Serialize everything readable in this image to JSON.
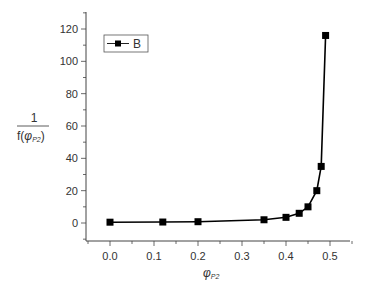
{
  "chart_data": {
    "type": "line",
    "title": "",
    "xlabel": "φ_P2",
    "ylabel": "1 / f(φ_P2)",
    "xlim": [
      -0.1,
      0.55
    ],
    "ylim": [
      -10,
      130
    ],
    "x_ticks": [
      0.0,
      0.1,
      0.2,
      0.3,
      0.4,
      0.5
    ],
    "x_tick_labels": [
      "0.0",
      "0.1",
      "0.2",
      "0.3",
      "0.4",
      "0.5"
    ],
    "y_ticks": [
      0,
      20,
      40,
      60,
      80,
      100,
      120
    ],
    "y_tick_labels": [
      "0",
      "20",
      "40",
      "60",
      "80",
      "100",
      "120"
    ],
    "grid": false,
    "legend_position": "upper-left",
    "series": [
      {
        "name": "B",
        "marker": "square",
        "color": "#000000",
        "x": [
          0.0,
          0.12,
          0.2,
          0.35,
          0.4,
          0.43,
          0.45,
          0.47,
          0.48,
          0.49
        ],
        "y": [
          0.5,
          0.6,
          0.8,
          2,
          3.5,
          6,
          10,
          20,
          35,
          116
        ]
      }
    ]
  },
  "legend": {
    "label": "B"
  },
  "axes": {
    "ylabel_numerator": "1",
    "ylabel_denominator_prefix": "f(",
    "ylabel_phi": "φ",
    "ylabel_sub": "P2",
    "ylabel_suffix": ")",
    "xlabel_phi": "φ",
    "xlabel_sub": "P2"
  }
}
